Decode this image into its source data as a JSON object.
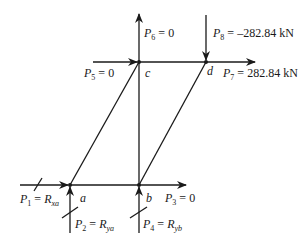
{
  "diagram": {
    "type": "truss-free-body",
    "line_color": "#1a1a1a",
    "nodes": [
      {
        "id": "a",
        "label": "a",
        "x": 70,
        "y": 185
      },
      {
        "id": "b",
        "label": "b",
        "x": 139,
        "y": 185
      },
      {
        "id": "c",
        "label": "c",
        "x": 139,
        "y": 62
      },
      {
        "id": "d",
        "label": "d",
        "x": 206,
        "y": 62
      }
    ],
    "members": [
      [
        "a",
        "b"
      ],
      [
        "c",
        "d"
      ],
      [
        "b",
        "c"
      ],
      [
        "a",
        "c"
      ],
      [
        "b",
        "d"
      ]
    ],
    "forces": [
      {
        "id": "P1",
        "sym": "P",
        "sub": "1",
        "eq": " = ",
        "rhs_sym": "R",
        "rhs_sub": "xa",
        "value": "",
        "direction": "right",
        "at": "a",
        "slashed": true
      },
      {
        "id": "P2",
        "sym": "P",
        "sub": "2",
        "eq": " = ",
        "rhs_sym": "R",
        "rhs_sub": "ya",
        "value": "",
        "direction": "up",
        "at": "a",
        "slashed": true
      },
      {
        "id": "P3",
        "sym": "P",
        "sub": "3",
        "eq": " = ",
        "rhs_sym": "",
        "rhs_sub": "",
        "value": "0",
        "direction": "right",
        "at": "b",
        "slashed": false
      },
      {
        "id": "P4",
        "sym": "P",
        "sub": "4",
        "eq": " = ",
        "rhs_sym": "R",
        "rhs_sub": "yb",
        "value": "",
        "direction": "up",
        "at": "b",
        "slashed": true
      },
      {
        "id": "P5",
        "sym": "P",
        "sub": "5",
        "eq": " = ",
        "rhs_sym": "",
        "rhs_sub": "",
        "value": "0",
        "direction": "right",
        "at": "c",
        "slashed": false
      },
      {
        "id": "P6",
        "sym": "P",
        "sub": "6",
        "eq": " = ",
        "rhs_sym": "",
        "rhs_sub": "",
        "value": "0",
        "direction": "up",
        "at": "c",
        "slashed": false
      },
      {
        "id": "P7",
        "sym": "P",
        "sub": "7",
        "eq": " = ",
        "rhs_sym": "",
        "rhs_sub": "",
        "value": "282.84 kN",
        "direction": "right",
        "at": "d",
        "slashed": false
      },
      {
        "id": "P8",
        "sym": "P",
        "sub": "8",
        "eq": " = ",
        "rhs_sym": "",
        "rhs_sub": "",
        "value": "–282.84 kN",
        "direction": "down",
        "at": "d",
        "slashed": false
      }
    ]
  }
}
